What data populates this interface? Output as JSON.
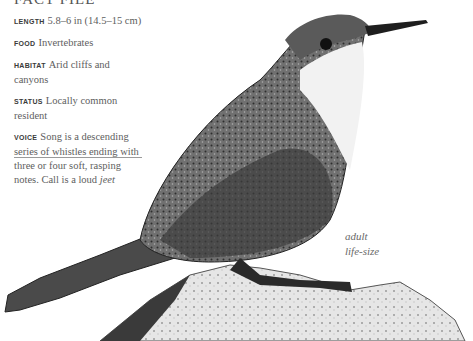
{
  "factfile": {
    "title": "FACT FILE",
    "length": {
      "label": "LENGTH",
      "value": "5.8–6 in (14.5–15 cm)"
    },
    "food": {
      "label": "FOOD",
      "value": "Invertebrates"
    },
    "habitat": {
      "label": "HABITAT",
      "value": "Arid cliffs and canyons"
    },
    "status": {
      "label": "STATUS",
      "value": "Locally common resident"
    },
    "voice": {
      "label": "VOICE",
      "value": "Song is a descending series of whistles ending with three or four soft, rasping notes. Call is a loud",
      "call": "jeet"
    }
  },
  "caption": {
    "line1": "adult",
    "line2": "life-size"
  },
  "illustration": {
    "subject": "bird-on-rock",
    "palette": {
      "dark": "#2a2a2a",
      "mid": "#6e6e6e",
      "light": "#d8d8d8",
      "throat": "#f2f2f2"
    }
  }
}
